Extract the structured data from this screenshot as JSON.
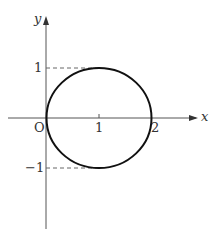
{
  "diagram": {
    "type": "circle-on-axes",
    "axes": {
      "x_label": "x",
      "y_label": "y",
      "origin_label": "O"
    },
    "ticks": {
      "x": [
        "1",
        "2"
      ],
      "y": [
        "1",
        "−1"
      ]
    },
    "circle": {
      "center": [
        1,
        0
      ],
      "radius": 1
    },
    "dashed_guides": [
      "y=1",
      "y=-1"
    ],
    "colors": {
      "axis": "#555555",
      "curve": "#111111",
      "dash": "#666666"
    }
  }
}
